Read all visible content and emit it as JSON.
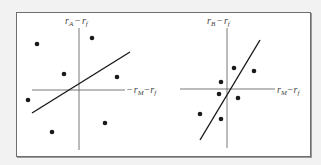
{
  "figure": {
    "background": "#f2f2f2",
    "frame_color": "#6e6e6e",
    "ink_color": "#1a1a1a",
    "panels": [
      {
        "id": "A",
        "y_axis_label": {
          "var": "r",
          "sub": "A",
          "minus": "−",
          "var2": "r",
          "sub2": "f"
        },
        "x_axis_label": {
          "var": "r",
          "sub": "M",
          "minus": "−",
          "var2": "r",
          "sub2": "f"
        },
        "description": "Low-beta asset: widely scattered points, flat regression line",
        "points": [
          [
            37,
            44
          ],
          [
            92,
            38
          ],
          [
            64,
            74
          ],
          [
            117,
            77
          ],
          [
            28,
            100
          ],
          [
            52,
            132
          ],
          [
            105,
            123
          ]
        ],
        "regression_line": [
          [
            32,
            113
          ],
          [
            130,
            52
          ]
        ]
      },
      {
        "id": "B",
        "y_axis_label": {
          "var": "r",
          "sub": "B",
          "minus": "−",
          "var2": "r",
          "sub2": "f"
        },
        "x_axis_label": {
          "var": "r",
          "sub": "M",
          "minus": "−",
          "var2": "r",
          "sub2": "f"
        },
        "description": "High-beta asset: tightly clustered points, steep regression line",
        "points": [
          [
            234,
            68
          ],
          [
            254,
            71
          ],
          [
            221,
            82
          ],
          [
            219,
            94
          ],
          [
            238,
            98
          ],
          [
            200,
            114
          ],
          [
            221,
            119
          ]
        ],
        "regression_line": [
          [
            200,
            140
          ],
          [
            260,
            40
          ]
        ]
      }
    ]
  }
}
